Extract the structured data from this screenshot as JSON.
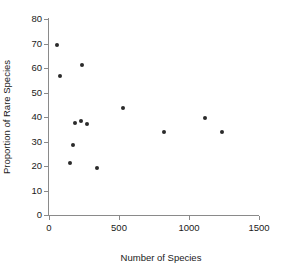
{
  "chart_data": {
    "type": "scatter",
    "title": "",
    "xlabel": "Number of Species",
    "ylabel": "Proportion of Rare Species",
    "xlim": [
      0,
      1500
    ],
    "ylim": [
      0,
      80
    ],
    "xticks": [
      0,
      500,
      1000,
      1500
    ],
    "yticks": [
      0,
      10,
      20,
      30,
      40,
      50,
      60,
      70,
      80
    ],
    "xtick_labels": [
      "0",
      "500",
      "1000",
      "1500"
    ],
    "ytick_labels": [
      "0",
      "10",
      "20",
      "30",
      "40",
      "50",
      "60",
      "70",
      "80"
    ],
    "grid": false,
    "legend": null,
    "marker": "filled-circle",
    "marker_color": "#2b2b2b",
    "points": [
      {
        "x": 57,
        "y": 69.3
      },
      {
        "x": 79,
        "y": 56.7
      },
      {
        "x": 236,
        "y": 61.2
      },
      {
        "x": 186,
        "y": 37.5
      },
      {
        "x": 229,
        "y": 38.4
      },
      {
        "x": 271,
        "y": 37.1
      },
      {
        "x": 171,
        "y": 28.6
      },
      {
        "x": 150,
        "y": 21.2
      },
      {
        "x": 343,
        "y": 19.2
      },
      {
        "x": 529,
        "y": 43.7
      },
      {
        "x": 821,
        "y": 33.9
      },
      {
        "x": 1114,
        "y": 39.6
      },
      {
        "x": 1236,
        "y": 33.9
      }
    ]
  }
}
